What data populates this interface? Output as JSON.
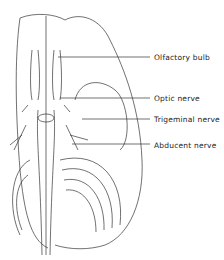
{
  "figure": {
    "labels": [
      {
        "text": "Olfactory bulb",
        "x": 154,
        "y": 53,
        "line_from_x": 58,
        "line_y": 57
      },
      {
        "text": "Optic nerve",
        "x": 154,
        "y": 94,
        "line_from_x": 60,
        "line_y": 98
      },
      {
        "text": "Trigeminal nerve",
        "x": 154,
        "y": 115,
        "line_from_x": 82,
        "line_y": 119
      },
      {
        "text": "Abducent nerve",
        "x": 154,
        "y": 141,
        "line_from_x": 72,
        "line_y": 144
      }
    ]
  }
}
